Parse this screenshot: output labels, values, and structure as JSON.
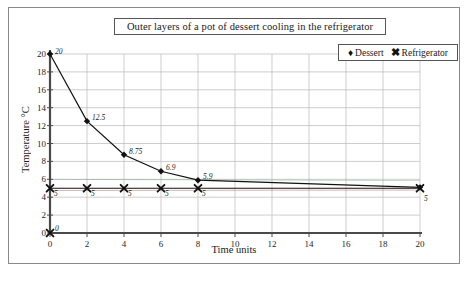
{
  "chart_data": {
    "type": "line",
    "title": "Outer layers of a pot of dessert cooling in the refrigerator",
    "xlabel": "Time units",
    "ylabel": "Temperature °C",
    "xlim": [
      0,
      20
    ],
    "ylim": [
      0,
      20
    ],
    "xticks": [
      0,
      2,
      4,
      6,
      8,
      10,
      12,
      14,
      16,
      18,
      20
    ],
    "yticks": [
      0,
      2,
      4,
      6,
      8,
      10,
      12,
      14,
      16,
      18,
      20
    ],
    "grid": true,
    "legend_position": "top-right",
    "series": [
      {
        "name": "Dessert",
        "marker": "diamond",
        "color": "#111111",
        "x": [
          0,
          2,
          4,
          6,
          8,
          20
        ],
        "y": [
          20,
          12.5,
          8.75,
          6.9,
          5.9,
          5.1
        ],
        "labels": [
          "20",
          "12.5",
          "8.75",
          "6.9",
          "5.9",
          ""
        ]
      },
      {
        "name": "Refrigerator",
        "marker": "x",
        "color": "#111111",
        "x": [
          0,
          2,
          4,
          6,
          8,
          20
        ],
        "y": [
          5,
          5,
          5,
          5,
          5,
          5
        ],
        "labels": [
          "5",
          "5",
          "5",
          "5",
          "5",
          "5"
        ]
      },
      {
        "name": "Origin",
        "marker": "x",
        "color": "#111111",
        "x": [
          0
        ],
        "y": [
          0
        ],
        "labels": [
          "0"
        ]
      }
    ]
  },
  "chart": {
    "title": "Outer layers of a pot of dessert cooling in the refrigerator",
    "x_axis_title": "Time units",
    "y_axis_title": "Temperature °C",
    "legend": [
      {
        "marker": "♦",
        "label": "Dessert"
      },
      {
        "marker": "✖",
        "label": "Refrigerator"
      }
    ],
    "y_tick_labels": [
      "20",
      "18",
      "16",
      "14",
      "12",
      "10",
      "8",
      "6",
      "4",
      "2",
      "0"
    ],
    "x_tick_labels": [
      "0",
      "2",
      "4",
      "6",
      "8",
      "10",
      "12",
      "14",
      "16",
      "18",
      "20"
    ],
    "colors": {
      "axis": "#4a4a4a",
      "grid": "#b9b9b9",
      "series": "#111111",
      "frame": "#8a8a8a",
      "text": "#1a1a1a"
    }
  }
}
